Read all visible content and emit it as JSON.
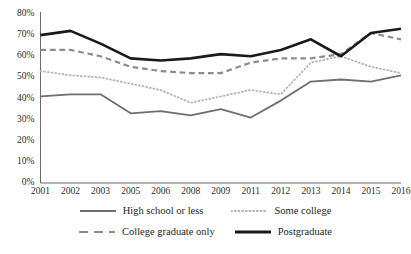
{
  "chart_data": {
    "type": "line",
    "title": "",
    "xlabel": "",
    "ylabel": "",
    "categories": [
      "2001",
      "2002",
      "2003",
      "2005",
      "2006",
      "2008",
      "2009",
      "2011",
      "2012",
      "2013",
      "2014",
      "2015",
      "2016"
    ],
    "ylim": [
      0,
      80
    ],
    "ytick_labels": [
      "0%",
      "10%",
      "20%",
      "30%",
      "40%",
      "50%",
      "60%",
      "70%",
      "80%"
    ],
    "ytick_values": [
      0,
      10,
      20,
      30,
      40,
      50,
      60,
      70,
      80
    ],
    "grid": false,
    "legend_position": "bottom",
    "series": [
      {
        "name": "High school or less",
        "style": "solid",
        "color": "#6e6e6e",
        "width": 1.8,
        "values": [
          41,
          42,
          42,
          33,
          34,
          32,
          35,
          31,
          39,
          48,
          49,
          48,
          51
        ]
      },
      {
        "name": "Some college",
        "style": "dotted",
        "color": "#b4b4b4",
        "width": 1.8,
        "values": [
          53,
          51,
          50,
          47,
          44,
          38,
          41,
          44,
          42,
          57,
          60,
          55,
          52
        ]
      },
      {
        "name": "College graduate only",
        "style": "dashed",
        "color": "#8c8c8c",
        "width": 2.2,
        "values": [
          63,
          63,
          60,
          55,
          53,
          52,
          52,
          57,
          59,
          59,
          61,
          71,
          68
        ]
      },
      {
        "name": "Postgraduate",
        "style": "solid",
        "color": "#1a1a1a",
        "width": 2.6,
        "values": [
          70,
          72,
          66,
          59,
          58,
          59,
          61,
          60,
          63,
          68,
          60,
          71,
          73
        ]
      }
    ]
  },
  "legend": {
    "items": [
      {
        "label": "High school or less"
      },
      {
        "label": "Some college"
      },
      {
        "label": "College graduate only"
      },
      {
        "label": "Postgraduate"
      }
    ]
  },
  "axis": {
    "color": "#5a5a5a"
  }
}
